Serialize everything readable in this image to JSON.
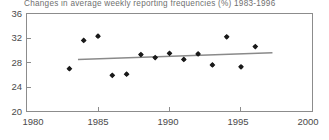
{
  "chart_data": {
    "type": "scatter",
    "title": "Changes in average weekly reporting frequencies (%) 1983-1996",
    "xlabel": "",
    "ylabel": "",
    "xlim": [
      1980,
      2000
    ],
    "ylim": [
      20,
      36
    ],
    "xticks": [
      1980,
      1985,
      1990,
      1995,
      2000
    ],
    "xtick_labels": [
      "1980",
      "1985",
      "1990",
      "1995",
      "2000"
    ],
    "yticks": [
      20,
      24,
      28,
      32,
      36
    ],
    "ytick_labels": [
      "20",
      "24",
      "28",
      "32",
      "36"
    ],
    "grid": false,
    "legend": null,
    "series": [
      {
        "name": "Average weekly reporting frequency",
        "marker": "diamond",
        "color": "#1a1a1a",
        "x": [
          1983,
          1984,
          1985,
          1986,
          1987,
          1988,
          1989,
          1990,
          1991,
          1992,
          1993,
          1994,
          1995,
          1996
        ],
        "y": [
          27.0,
          31.6,
          32.3,
          25.9,
          26.1,
          29.3,
          28.8,
          29.5,
          28.5,
          29.4,
          27.6,
          32.2,
          27.3,
          30.6
        ]
      }
    ],
    "trend_line": {
      "name": "Linear trend",
      "color": "#8a8a8a",
      "x": [
        1983.6,
        1997.2
      ],
      "y": [
        28.5,
        29.6
      ]
    }
  },
  "axes": {
    "y_labels": [
      "36",
      "32",
      "28",
      "24",
      "20"
    ],
    "x_labels": [
      "1980",
      "1985",
      "1990",
      "1995",
      "2000"
    ]
  }
}
